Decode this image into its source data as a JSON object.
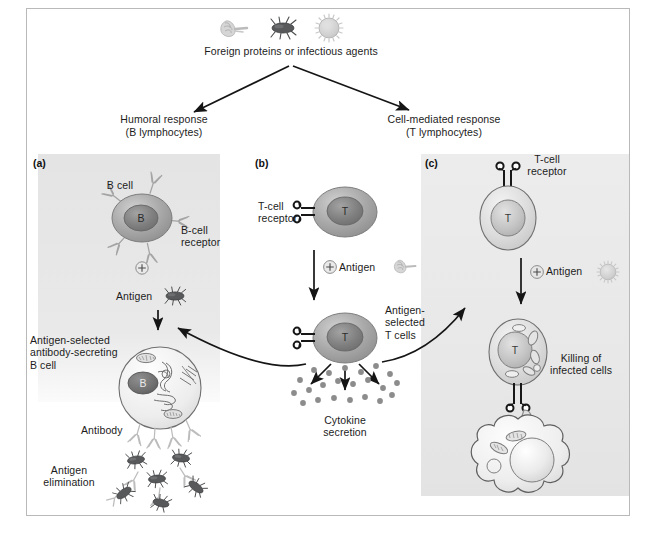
{
  "figure": {
    "title_top": "Foreign proteins or infectious agents",
    "branches": [
      {
        "name": "humoral",
        "line1": "Humoral response",
        "line2": "(B lymphocytes)"
      },
      {
        "name": "cell_mediated",
        "line1": "Cell-mediated response",
        "line2": "(T lymphocytes)"
      }
    ]
  },
  "panels": [
    {
      "id": "a",
      "label": "(a)",
      "shaded": true,
      "labels": {
        "cell_name": "B cell",
        "receptor": "B-cell\nreceptor",
        "plus": "+",
        "antigen": "Antigen",
        "activated_cell": "Antigen-selected\nantibody-secreting\nB cell",
        "antibody": "Antibody",
        "outcome": "Antigen\nelimination",
        "nucleus_letter": "B"
      }
    },
    {
      "id": "b",
      "label": "(b)",
      "shaded": false,
      "labels": {
        "receptor": "T-cell\nreceptor",
        "plus_antigen": "Antigen",
        "plus": "+",
        "activated_cells": "Antigen-\nselected\nT cells",
        "outcome": "Cytokine\nsecretion",
        "nucleus_letter": "T"
      }
    },
    {
      "id": "c",
      "label": "(c)",
      "shaded": true,
      "labels": {
        "receptor": "T-cell\nreceptor",
        "plus_antigen": "Antigen",
        "plus": "+",
        "outcome": "Killing of\ninfected cells",
        "nucleus_letter": "T"
      }
    }
  ],
  "pathogen_icons": [
    {
      "name": "protein-coil-icon"
    },
    {
      "name": "bacterium-icon"
    },
    {
      "name": "virus-icon"
    }
  ],
  "colors": {
    "panel_shade": "#e8e8e8",
    "cell_membrane_dark": "#9a9a9a",
    "cell_membrane_light": "#d9d9d9",
    "nucleus_dark": "#7d7d7d",
    "nucleus_light": "#bdbdbd",
    "bacterium_body": "#57585a",
    "cytokine_dot": "#8c8c8c",
    "outline": "#3a3a3a",
    "text": "#1c1c1c",
    "frame": "#b9b9b9"
  },
  "counts": {
    "cytokine_dots": 22,
    "eliminated_antigens": 6,
    "b_cell_receptors": 5,
    "secreted_antibodies": 4
  }
}
